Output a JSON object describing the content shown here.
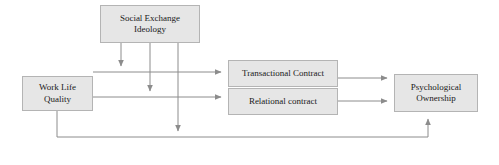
{
  "diagram": {
    "type": "conceptual-model",
    "colors": {
      "node_fill": "#e6e6e6",
      "node_border": "#b4b4b4",
      "edge": "#8c8c8c",
      "text": "#1a1a1a",
      "background": "#ffffff"
    },
    "nodes": [
      {
        "id": "social_exchange_ideology",
        "label": "Social Exchange\nIdeology",
        "role": "moderator"
      },
      {
        "id": "work_life_quality",
        "label": "Work Life\nQuality",
        "role": "independent-variable"
      },
      {
        "id": "transactional_contract",
        "label": "Transactional Contract",
        "role": "mediator"
      },
      {
        "id": "relational_contract",
        "label": "Relational contract",
        "role": "mediator"
      },
      {
        "id": "psychological_ownership",
        "label": "Psychological\nOwnership",
        "role": "dependent-variable"
      }
    ],
    "edges": [
      {
        "id": "wlq-to-transactional",
        "from": "work_life_quality",
        "to": "transactional_contract",
        "style": "arrow"
      },
      {
        "id": "wlq-to-relational",
        "from": "work_life_quality",
        "to": "relational_contract",
        "style": "arrow"
      },
      {
        "id": "transactional-to-po",
        "from": "transactional_contract",
        "to": "psychological_ownership",
        "style": "arrow"
      },
      {
        "id": "relational-to-po",
        "from": "relational_contract",
        "to": "psychological_ownership",
        "style": "arrow"
      },
      {
        "id": "wlq-to-po-direct",
        "from": "work_life_quality",
        "to": "psychological_ownership",
        "style": "arrow-elbow"
      },
      {
        "id": "sei-moderates-path1",
        "from": "social_exchange_ideology",
        "to": "wlq-to-transactional",
        "style": "arrow-moderation"
      },
      {
        "id": "sei-moderates-path2",
        "from": "social_exchange_ideology",
        "to": "wlq-to-relational",
        "style": "arrow-moderation"
      },
      {
        "id": "sei-moderates-path3",
        "from": "social_exchange_ideology",
        "to": "wlq-to-po-direct",
        "style": "arrow-moderation"
      }
    ]
  }
}
